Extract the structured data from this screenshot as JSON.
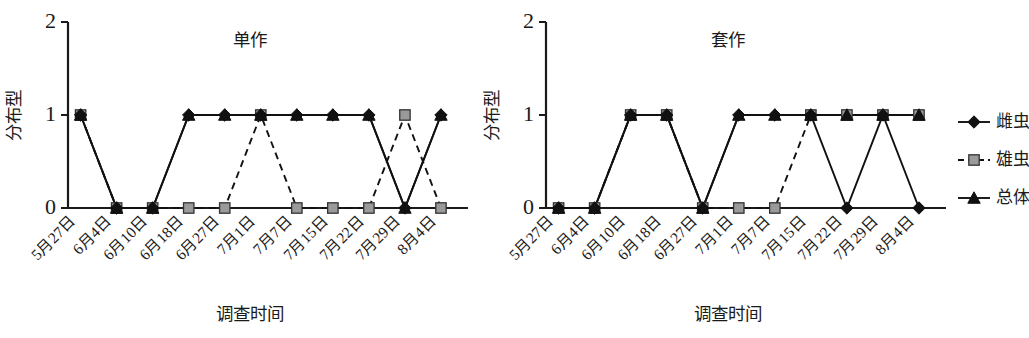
{
  "figure": {
    "y_axis_title": "分布型",
    "x_axis_title": "调查时间",
    "y_ticks": [
      "0",
      "1",
      "2"
    ],
    "y_min": 0,
    "y_max": 2,
    "categories": [
      "5月27日",
      "6月4日",
      "6月10日",
      "6月18日",
      "6月27日",
      "7月1日",
      "7月7日",
      "7月15日",
      "7月22日",
      "7月29日",
      "8月4日"
    ]
  },
  "legend": {
    "items": [
      {
        "label": "雌虫",
        "marker": "diamond",
        "line": "solid",
        "color": "#111111"
      },
      {
        "label": "雄虫",
        "marker": "square",
        "line": "dashed",
        "color": "#9a9a9a"
      },
      {
        "label": "总体",
        "marker": "triangle",
        "line": "solid",
        "color": "#111111"
      }
    ]
  },
  "chart_data": [
    {
      "type": "line",
      "title": "单作",
      "xlabel": "调查时间",
      "ylabel": "分布型",
      "ylim": [
        0,
        2
      ],
      "grid": false,
      "legend_position": "right-outside",
      "categories": [
        "5月27日",
        "6月4日",
        "6月10日",
        "6月18日",
        "6月27日",
        "7月1日",
        "7月7日",
        "7月15日",
        "7月22日",
        "7月29日",
        "8月4日"
      ],
      "series": [
        {
          "name": "雌虫",
          "marker": "diamond",
          "line": "solid",
          "values": [
            1,
            0,
            0,
            1,
            1,
            1,
            1,
            1,
            1,
            0,
            1
          ]
        },
        {
          "name": "雄虫",
          "marker": "square",
          "line": "dashed",
          "values": [
            1,
            0,
            0,
            0,
            0,
            1,
            0,
            0,
            0,
            1,
            0
          ]
        },
        {
          "name": "总体",
          "marker": "triangle",
          "line": "solid",
          "values": [
            1,
            0,
            0,
            1,
            1,
            1,
            1,
            1,
            1,
            0,
            1
          ]
        }
      ]
    },
    {
      "type": "line",
      "title": "套作",
      "xlabel": "调查时间",
      "ylabel": "分布型",
      "ylim": [
        0,
        2
      ],
      "grid": false,
      "legend_position": "right-outside",
      "categories": [
        "5月27日",
        "6月4日",
        "6月10日",
        "6月18日",
        "6月27日",
        "7月1日",
        "7月7日",
        "7月15日",
        "7月22日",
        "7月29日",
        "8月4日"
      ],
      "series": [
        {
          "name": "雌虫",
          "marker": "diamond",
          "line": "solid",
          "values": [
            0,
            0,
            1,
            1,
            0,
            1,
            1,
            1,
            0,
            1,
            0
          ]
        },
        {
          "name": "雄虫",
          "marker": "square",
          "line": "dashed",
          "values": [
            0,
            0,
            1,
            1,
            0,
            0,
            0,
            1,
            1,
            1,
            1
          ]
        },
        {
          "name": "总体",
          "marker": "triangle",
          "line": "solid",
          "values": [
            0,
            0,
            1,
            1,
            0,
            1,
            1,
            1,
            1,
            1,
            1
          ]
        }
      ]
    }
  ]
}
